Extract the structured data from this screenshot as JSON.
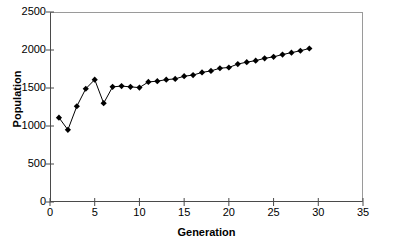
{
  "chart_data": {
    "type": "line",
    "title": "",
    "subtitle": "",
    "xlabel": "Generation",
    "ylabel": "Population",
    "xlim": [
      0,
      35
    ],
    "ylim": [
      0,
      2500
    ],
    "xticks": [
      0,
      5,
      10,
      15,
      20,
      25,
      30,
      35
    ],
    "yticks": [
      0,
      500,
      1000,
      1500,
      2000,
      2500
    ],
    "xtick_labels": [
      "0",
      "5",
      "10",
      "15",
      "20",
      "25",
      "30",
      "35"
    ],
    "ytick_labels": [
      "0",
      "500",
      "1000",
      "1500",
      "2000",
      "2500"
    ],
    "grid": false,
    "legend": false,
    "legend_position": "none",
    "marker": "diamond",
    "marker_color": "#000000",
    "line_color": "#000000",
    "background_color": "#ffffff",
    "frame_color": "#808080",
    "x": [
      1,
      2,
      3,
      4,
      5,
      6,
      7,
      8,
      9,
      10,
      11,
      12,
      13,
      14,
      15,
      16,
      17,
      18,
      19,
      20,
      21,
      22,
      23,
      24,
      25,
      26,
      27,
      28,
      29
    ],
    "values": [
      1110,
      950,
      1260,
      1490,
      1610,
      1300,
      1515,
      1525,
      1515,
      1505,
      1580,
      1590,
      1610,
      1620,
      1655,
      1670,
      1705,
      1725,
      1760,
      1770,
      1815,
      1840,
      1860,
      1890,
      1910,
      1940,
      1965,
      1990,
      2020
    ],
    "series": [
      {
        "name": "Population",
        "values": [
          1110,
          950,
          1260,
          1490,
          1610,
          1300,
          1515,
          1525,
          1515,
          1505,
          1580,
          1590,
          1610,
          1620,
          1655,
          1670,
          1705,
          1725,
          1760,
          1770,
          1815,
          1840,
          1860,
          1890,
          1910,
          1940,
          1965,
          1990,
          2020
        ]
      }
    ]
  },
  "axes": {
    "y_labels": [
      "2500",
      "2000",
      "1500",
      "1000",
      "500",
      "0"
    ],
    "x_labels": [
      "0",
      "5",
      "10",
      "15",
      "20",
      "25",
      "30",
      "35"
    ],
    "x_title": "Generation",
    "y_title": "Population"
  }
}
